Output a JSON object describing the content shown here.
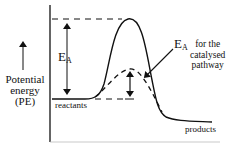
{
  "diagram": {
    "type": "energy-profile",
    "y_axis_label": [
      "Potential",
      "energy",
      "(PE)"
    ],
    "labels": {
      "activation_energy_symbol": "E",
      "activation_energy_subscript": "A",
      "catalysed_description": [
        "for the",
        "catalysed",
        "pathway"
      ],
      "reactants": "reactants",
      "products": "products"
    },
    "levels": {
      "uncatalysed_peak_y": 18,
      "catalysed_peak_y": 69,
      "reactants_y": 99,
      "products_y": 122
    },
    "colors": {
      "ink": "#111111",
      "background": "#ffffff"
    }
  }
}
